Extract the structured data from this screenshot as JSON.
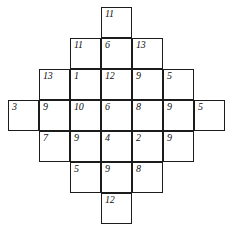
{
  "diagram": {
    "type": "number-grid-diamond",
    "title": "",
    "cell_size": 31,
    "origin_x": 8,
    "origin_y": 7,
    "columns": 7,
    "rows": 7,
    "line_color": "#1c1c1c",
    "text_color": "#101010",
    "background_color": "#ffffff",
    "rows_data": [
      {
        "row": 0,
        "start_col": 3,
        "values": [
          "11"
        ]
      },
      {
        "row": 1,
        "start_col": 2,
        "values": [
          "11",
          "6",
          "13"
        ]
      },
      {
        "row": 2,
        "start_col": 1,
        "values": [
          "13",
          "1",
          "12",
          "9",
          "5"
        ]
      },
      {
        "row": 3,
        "start_col": 0,
        "values": [
          "3",
          "9",
          "10",
          "6",
          "8",
          "9",
          "5"
        ]
      },
      {
        "row": 4,
        "start_col": 1,
        "values": [
          "7",
          "9",
          "4",
          "2",
          "9"
        ]
      },
      {
        "row": 5,
        "start_col": 2,
        "values": [
          "5",
          "9",
          "8"
        ]
      },
      {
        "row": 6,
        "start_col": 3,
        "values": [
          "12"
        ]
      }
    ],
    "all_values": [
      "11",
      "11",
      "6",
      "13",
      "13",
      "1",
      "12",
      "9",
      "5",
      "3",
      "9",
      "10",
      "6",
      "8",
      "9",
      "5",
      "7",
      "9",
      "4",
      "2",
      "9",
      "5",
      "9",
      "8",
      "12"
    ],
    "cell_count": 25
  }
}
